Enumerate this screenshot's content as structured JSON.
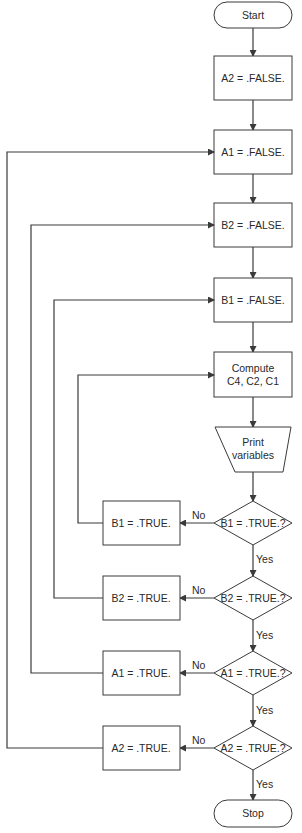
{
  "diagram": {
    "type": "flowchart",
    "nodes": {
      "start": "Start",
      "a2_false": "A2 = .FALSE.",
      "a1_false": "A1 = .FALSE.",
      "b2_false": "B2 = .FALSE.",
      "b1_false": "B1 = .FALSE.",
      "compute_line1": "Compute",
      "compute_line2": "C4, C2, C1",
      "print_line1": "Print",
      "print_line2": "variables",
      "dec_b1": "B1 = .TRUE.?",
      "dec_b2": "B2 = .TRUE.?",
      "dec_a1": "A1 = .TRUE.?",
      "dec_a2": "A2 = .TRUE.?",
      "set_b1": "B1 = .TRUE.",
      "set_b2": "B2 = .TRUE.",
      "set_a1": "A1 = .TRUE.",
      "set_a2": "A2 = .TRUE.",
      "stop": "Stop"
    },
    "labels": {
      "no": "No",
      "yes": "Yes"
    },
    "colors": {
      "stroke": "#3a3a3a",
      "text": "#2a2a2a",
      "background": "#ffffff"
    }
  }
}
